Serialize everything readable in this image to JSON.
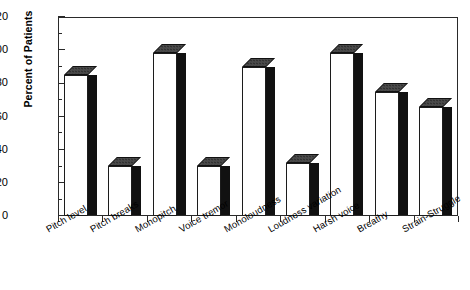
{
  "chart_data": {
    "type": "bar",
    "title": "",
    "subtitle": "",
    "xlabel": "",
    "ylabel": "Percent of Patients",
    "ylim": [
      0,
      120
    ],
    "yticks": [
      0,
      20,
      40,
      60,
      80,
      100,
      120
    ],
    "minor_tick_step": 10,
    "grid": false,
    "legend": "none",
    "style": "3d-bar",
    "categories": [
      "Pitch level",
      "Pitch breaks",
      "Monopitch",
      "Voice tremor",
      "Monoloudness",
      "Loudness variation",
      "Harsh voice",
      "Breathy",
      "Strain-Struggle"
    ],
    "values": [
      85,
      30,
      98,
      30,
      90,
      32,
      98,
      75,
      66
    ],
    "annotations": []
  },
  "axes": {
    "y_title": "Percent of Patients",
    "y_tick_labels": [
      "0",
      "20",
      "40",
      "60",
      "80",
      "100",
      "120"
    ],
    "x_tick_labels": [
      "Pitch level",
      "Pitch breaks",
      "Monopitch",
      "Voice tremor",
      "Monoloudness",
      "Loudness variation",
      "Harsh voice",
      "Breathy",
      "Strain-Struggle"
    ]
  },
  "colors": {
    "bar_front": "#ffffff",
    "bar_side": "#111111",
    "bar_top": "#4a4a4a",
    "axis": "#2a2a2a",
    "text": "#000000",
    "background": "#ffffff"
  }
}
